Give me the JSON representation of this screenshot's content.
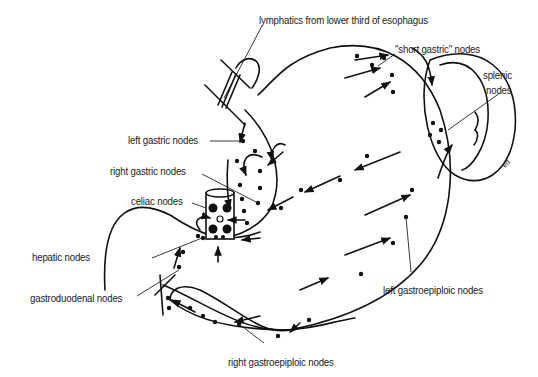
{
  "diagram": {
    "labels": {
      "esophagus": "lymphatics from lower third of esophagus",
      "short_gastric": "\"short gastric\" nodes",
      "splenic_1": "splenic",
      "splenic_2": "nodes",
      "left_gastric": "left gastric nodes",
      "right_gastric": "right gastric nodes",
      "celiac": "celiac nodes",
      "hepatic": "hepatic nodes",
      "gastroduodenal": "gastroduodenal nodes",
      "left_gastroepiploic": "left gastroepiploic nodes",
      "right_gastroepiploic": "right gastroepiploic nodes"
    },
    "signature": "ed",
    "colors": {
      "ink": "#111111",
      "background": "#ffffff"
    }
  }
}
